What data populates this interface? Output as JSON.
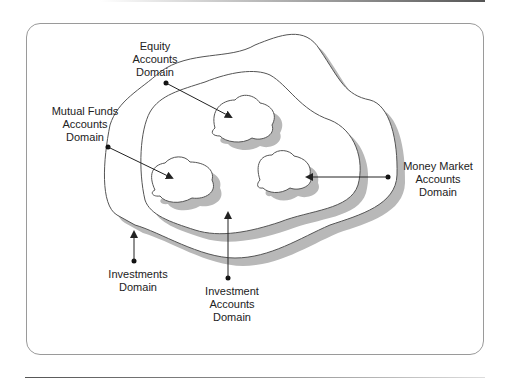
{
  "diagram": {
    "labels": {
      "equity": "Equity\nAccounts\nDomain",
      "mutual_funds": "Mutual Funds\nAccounts\nDomain",
      "money_market": "Money Market\nAccounts\nDomain",
      "investments": "Investments\nDomain",
      "investment_accounts": "Investment\nAccounts\nDomain"
    },
    "colors": {
      "outline": "#555555",
      "shadow": "#b8b8b8",
      "fill": "#ffffff",
      "frame": "#9a9a9a"
    }
  }
}
